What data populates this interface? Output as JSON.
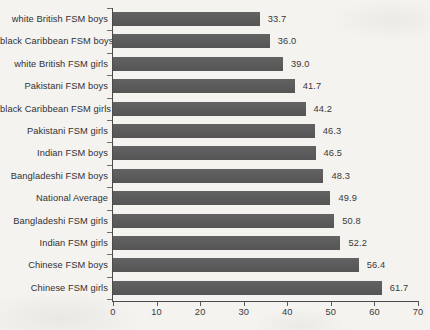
{
  "chart_data": {
    "type": "bar",
    "orientation": "horizontal",
    "title": "",
    "subtitle": "",
    "xlabel": "",
    "ylabel": "",
    "xlim": [
      0,
      70
    ],
    "ylim": null,
    "grid": false,
    "legend": null,
    "legend_position": "none",
    "xticks": [
      0,
      10,
      20,
      30,
      40,
      50,
      60,
      70
    ],
    "xtick_labels": [
      "0",
      "10",
      "20",
      "30",
      "40",
      "50",
      "60",
      "70"
    ],
    "bar_color": "#595959",
    "categories": [
      "white British FSM boys",
      "black Caribbean FSM boys",
      "white British FSM girls",
      "Pakistani FSM boys",
      "black Caribbean FSM girls",
      "Pakistani FSM girls",
      "Indian FSM boys",
      "Bangladeshi FSM boys",
      "National Average",
      "Bangladeshi FSM girls",
      "Indian FSM girls",
      "Chinese FSM boys",
      "Chinese FSM girls"
    ],
    "values": [
      33.7,
      36.0,
      39.0,
      41.7,
      44.2,
      46.3,
      46.5,
      48.3,
      49.9,
      50.8,
      52.2,
      56.4,
      61.7
    ],
    "value_labels": [
      "33.7",
      "36.0",
      "39.0",
      "41.7",
      "44.2",
      "46.3",
      "46.5",
      "48.3",
      "49.9",
      "50.8",
      "52.2",
      "56.4",
      "61.7"
    ]
  }
}
